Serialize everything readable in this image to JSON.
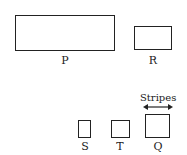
{
  "shapes": [
    {
      "id": "P",
      "label": "P"
    },
    {
      "id": "R",
      "label": "R"
    },
    {
      "id": "S",
      "label": "S"
    },
    {
      "id": "T",
      "label": "T"
    },
    {
      "id": "Q",
      "label": "Q"
    }
  ],
  "annotation": {
    "label": "Stripes"
  }
}
